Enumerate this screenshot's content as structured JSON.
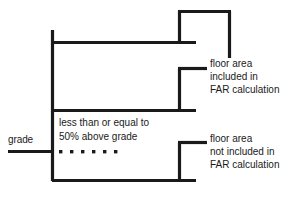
{
  "diagram": {
    "stroke_color": "#1a1a1a",
    "background_color": "#ffffff",
    "grade_label": "grade",
    "note": {
      "line1": "less than or equal to",
      "line2": "50% above grade"
    },
    "legend_included": {
      "line1": "floor area",
      "line2": "included in",
      "line3": "FAR calculation"
    },
    "legend_not_included": {
      "line1": "floor area",
      "line2": "not included in",
      "line3": "FAR calculation"
    },
    "dotted_line": {
      "dot_count": 6,
      "dot_size": 3,
      "y": 151
    }
  }
}
